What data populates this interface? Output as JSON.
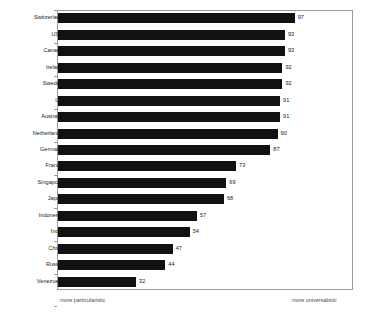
{
  "chart_data": {
    "type": "bar",
    "orientation": "horizontal",
    "title": "",
    "subtitle": "",
    "xlabel": "",
    "ylabel": "",
    "xlim": [
      0,
      100
    ],
    "grid": false,
    "legend": null,
    "legend_position": "none",
    "bar_color": "#111111",
    "frame_color": "#9a9a9a",
    "text_color": "#1a1a1a",
    "categories": [
      "Switzerland",
      "USA",
      "Canada",
      "Ireland",
      "Sweden",
      "UK",
      "Australia",
      "Netherlands",
      "Germany",
      "France",
      "Singapore",
      "Japan",
      "Indonesia",
      "India",
      "China",
      "Russia",
      "Venezuela"
    ],
    "values": [
      97,
      93,
      93,
      92,
      92,
      91,
      91,
      90,
      87,
      73,
      69,
      68,
      57,
      54,
      47,
      44,
      32
    ],
    "data_labels": [
      "97",
      "93",
      "93",
      "92",
      "92",
      "91",
      "91",
      "90",
      "87",
      "73",
      "69",
      "68",
      "57",
      "54",
      "47",
      "44",
      "32"
    ],
    "annotations": {
      "axis_left_note": "more particularistic",
      "axis_right_note": "more universalistic"
    }
  }
}
